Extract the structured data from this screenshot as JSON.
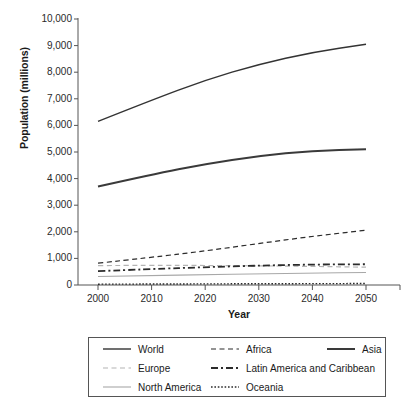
{
  "chart_data": {
    "type": "line",
    "title": "",
    "xlabel": "Year",
    "ylabel": "Population (millions)",
    "x": [
      2000,
      2010,
      2020,
      2030,
      2040,
      2050
    ],
    "xlim": [
      2000,
      2050
    ],
    "ylim": [
      0,
      10000
    ],
    "xticks": [
      "2000",
      "2010",
      "2020",
      "2030",
      "2040",
      "2050"
    ],
    "yticks": [
      "0",
      "1,000",
      "2,000",
      "3,000",
      "4,000",
      "5,000",
      "6,000",
      "7,000",
      "8,000",
      "9,000",
      "10,000"
    ],
    "ytick_values": [
      0,
      1000,
      2000,
      3000,
      4000,
      5000,
      6000,
      7000,
      8000,
      9000,
      10000
    ],
    "grid": false,
    "legend_position": "below-outside",
    "series": [
      {
        "name": "World",
        "style": "solid",
        "color": "#333333",
        "width": 1.4,
        "values": [
          6150,
          6950,
          7700,
          8300,
          8750,
          9050
        ]
      },
      {
        "name": "Africa",
        "style": "dashed",
        "color": "#2b2b2b",
        "width": 1.2,
        "values": [
          820,
          1040,
          1280,
          1560,
          1830,
          2060
        ]
      },
      {
        "name": "Asia",
        "style": "solid",
        "color": "#3a3a3a",
        "width": 2.0,
        "values": [
          3700,
          4150,
          4550,
          4850,
          5050,
          5100
        ]
      },
      {
        "name": "Europe",
        "style": "dashed",
        "color": "#b4b4b4",
        "width": 1.2,
        "values": [
          730,
          740,
          735,
          720,
          700,
          670
        ]
      },
      {
        "name": "Latin America and Caribbean",
        "style": "dashdot",
        "color": "#2b2b2b",
        "width": 1.8,
        "values": [
          520,
          600,
          670,
          730,
          770,
          780
        ]
      },
      {
        "name": "North America",
        "style": "solid",
        "color": "#a8a8a8",
        "width": 1.1,
        "values": [
          320,
          350,
          390,
          420,
          450,
          470
        ]
      },
      {
        "name": "Oceania",
        "style": "dotted",
        "color": "#2b2b2b",
        "width": 1.4,
        "values": [
          31,
          36,
          42,
          47,
          51,
          55
        ]
      }
    ]
  },
  "legend": {
    "rows": [
      [
        {
          "label": "World",
          "series": "World"
        },
        {
          "label": "Africa",
          "series": "Africa"
        },
        {
          "label": "Asia",
          "series": "Asia"
        }
      ],
      [
        {
          "label": "Europe",
          "series": "Europe"
        },
        {
          "label": "Latin America and Caribbean",
          "series": "Latin America and Caribbean"
        }
      ],
      [
        {
          "label": "North America",
          "series": "North America"
        },
        {
          "label": "Oceania",
          "series": "Oceania"
        }
      ]
    ]
  },
  "axis": {
    "spine_color": "#555555",
    "tick_color": "#555555"
  }
}
